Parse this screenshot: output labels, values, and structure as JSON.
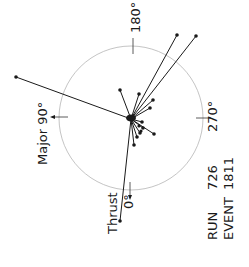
{
  "diagram": {
    "labels": {
      "deg180": "180°",
      "deg270": "270°",
      "major": "Major 90°",
      "thrust": "Thrust",
      "deg0": "0°",
      "run_label": "RUN",
      "run_value": "726",
      "event_label": "EVENT",
      "event_value": "1811"
    },
    "colors": {
      "circle": "#b5b5b5",
      "ink": "#1a1a1a",
      "background": "#ffffff"
    }
  }
}
